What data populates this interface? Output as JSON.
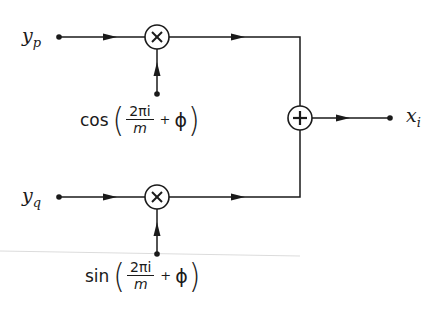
{
  "diagram": {
    "type": "signal-flow block diagram (quadrature modulator)",
    "inputs": [
      {
        "id": "yp",
        "symbol": "y",
        "subscript": "p"
      },
      {
        "id": "yq",
        "symbol": "y",
        "subscript": "q"
      }
    ],
    "multipliers": [
      {
        "id": "mult-top",
        "glyph": "×",
        "carrier": {
          "fn": "cos",
          "numerator": "2πi",
          "denominator": "m",
          "plus": "+",
          "phase": "ϕ"
        }
      },
      {
        "id": "mult-bottom",
        "glyph": "×",
        "carrier": {
          "fn": "sin",
          "numerator": "2πi",
          "denominator": "m",
          "plus": "+",
          "phase": "ϕ"
        }
      }
    ],
    "summer": {
      "id": "sum",
      "glyph": "+"
    },
    "output": {
      "id": "xi",
      "symbol": "x",
      "subscript": "i"
    },
    "colors": {
      "ink": "#1a1a1a",
      "background": "#ffffff",
      "scan_artifact": "#d8d8d8"
    }
  }
}
